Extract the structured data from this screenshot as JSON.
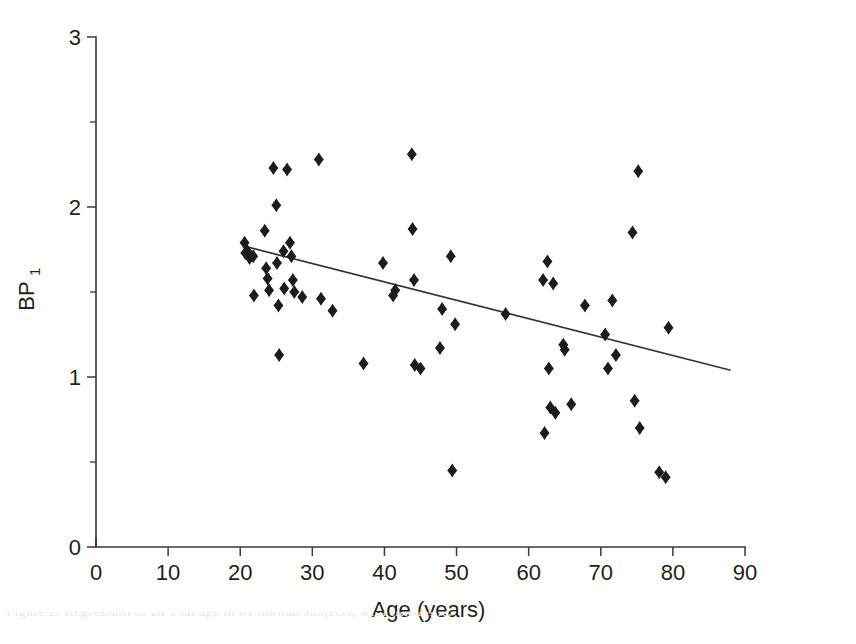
{
  "figure": {
    "background_color": "#ffffff",
    "marker_color": "#1c1c1c",
    "line_color": "#333333",
    "axis_color": "#3a3a3a",
    "partial_caption": "Figure 2. Regression of BP1 on age in 61 normal subjects, with fitted line."
  },
  "chart_data": {
    "type": "scatter",
    "title": "",
    "xlabel": "Age (years)",
    "ylabel": "BP",
    "ylabel_subscript": "1",
    "xlim": [
      0,
      90
    ],
    "ylim": [
      0,
      3
    ],
    "xticks": [
      0,
      10,
      20,
      30,
      40,
      50,
      60,
      70,
      80,
      90
    ],
    "yticks": [
      0,
      1,
      2,
      3
    ],
    "xtick_labels": [
      "0",
      "10",
      "20",
      "30",
      "40",
      "50",
      "60",
      "70",
      "80",
      "90"
    ],
    "ytick_labels": [
      "0",
      "1",
      "2",
      "3"
    ],
    "x_minor_tick_interval": 10,
    "y_minor_tick_interval": 0.5,
    "grid": false,
    "legend": false,
    "marker_shape": "diamond",
    "points": [
      {
        "x": 20.6,
        "y": 1.79
      },
      {
        "x": 20.7,
        "y": 1.73
      },
      {
        "x": 21.0,
        "y": 1.74
      },
      {
        "x": 21.3,
        "y": 1.7
      },
      {
        "x": 21.8,
        "y": 1.71
      },
      {
        "x": 21.9,
        "y": 1.48
      },
      {
        "x": 23.4,
        "y": 1.86
      },
      {
        "x": 23.6,
        "y": 1.64
      },
      {
        "x": 23.8,
        "y": 1.58
      },
      {
        "x": 24.0,
        "y": 1.51
      },
      {
        "x": 24.6,
        "y": 2.23
      },
      {
        "x": 25.0,
        "y": 2.01
      },
      {
        "x": 25.1,
        "y": 1.67
      },
      {
        "x": 25.3,
        "y": 1.42
      },
      {
        "x": 25.4,
        "y": 1.13
      },
      {
        "x": 26.0,
        "y": 1.74
      },
      {
        "x": 26.1,
        "y": 1.52
      },
      {
        "x": 26.5,
        "y": 2.22
      },
      {
        "x": 26.9,
        "y": 1.79
      },
      {
        "x": 27.1,
        "y": 1.71
      },
      {
        "x": 27.3,
        "y": 1.57
      },
      {
        "x": 27.5,
        "y": 1.5
      },
      {
        "x": 28.6,
        "y": 1.47
      },
      {
        "x": 30.9,
        "y": 2.28
      },
      {
        "x": 31.2,
        "y": 1.46
      },
      {
        "x": 32.8,
        "y": 1.39
      },
      {
        "x": 37.1,
        "y": 1.08
      },
      {
        "x": 39.8,
        "y": 1.67
      },
      {
        "x": 41.2,
        "y": 1.48
      },
      {
        "x": 41.5,
        "y": 1.51
      },
      {
        "x": 43.8,
        "y": 2.31
      },
      {
        "x": 43.9,
        "y": 1.87
      },
      {
        "x": 44.1,
        "y": 1.57
      },
      {
        "x": 44.2,
        "y": 1.07
      },
      {
        "x": 45.0,
        "y": 1.05
      },
      {
        "x": 47.7,
        "y": 1.17
      },
      {
        "x": 48.0,
        "y": 1.4
      },
      {
        "x": 49.2,
        "y": 1.71
      },
      {
        "x": 49.4,
        "y": 0.45
      },
      {
        "x": 49.8,
        "y": 1.31
      },
      {
        "x": 56.8,
        "y": 1.37
      },
      {
        "x": 62.0,
        "y": 1.57
      },
      {
        "x": 62.2,
        "y": 0.67
      },
      {
        "x": 62.6,
        "y": 1.68
      },
      {
        "x": 62.8,
        "y": 1.05
      },
      {
        "x": 63.0,
        "y": 0.82
      },
      {
        "x": 63.4,
        "y": 1.55
      },
      {
        "x": 63.7,
        "y": 0.79
      },
      {
        "x": 64.8,
        "y": 1.19
      },
      {
        "x": 65.0,
        "y": 1.16
      },
      {
        "x": 65.9,
        "y": 0.84
      },
      {
        "x": 67.8,
        "y": 1.42
      },
      {
        "x": 70.6,
        "y": 1.25
      },
      {
        "x": 71.0,
        "y": 1.05
      },
      {
        "x": 71.6,
        "y": 1.45
      },
      {
        "x": 72.1,
        "y": 1.13
      },
      {
        "x": 74.4,
        "y": 1.85
      },
      {
        "x": 74.7,
        "y": 0.86
      },
      {
        "x": 75.2,
        "y": 2.21
      },
      {
        "x": 75.4,
        "y": 0.7
      },
      {
        "x": 78.1,
        "y": 0.44
      },
      {
        "x": 79.0,
        "y": 0.41
      },
      {
        "x": 79.4,
        "y": 1.29
      }
    ],
    "fit_line": {
      "label": "fitted regression line",
      "x_start": 20.5,
      "y_start": 1.77,
      "x_end": 88.0,
      "y_end": 1.04
    }
  }
}
